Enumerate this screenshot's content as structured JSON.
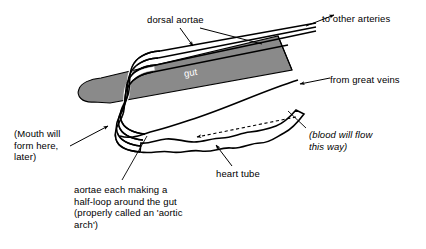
{
  "figure": {
    "kind": "embryo-circulatory-diagram",
    "background_color": "#ffffff",
    "line_color": "#000000",
    "gut_fill_color": "#8a8a8a",
    "gut_label_color": "#ffffff"
  },
  "labels": {
    "dorsal_aortae": "dorsal aortae",
    "to_other_arteries": "to other arteries",
    "from_great_veins": "from great veins",
    "gut": "gut",
    "heart_tube": "heart tube",
    "blood_flow_line1": "(blood will flow",
    "blood_flow_line2": "this way)",
    "mouth_line1": "(Mouth will",
    "mouth_line2": "form here,",
    "mouth_line3": "later)",
    "aortic_arch_line1": "aortae each making a",
    "aortic_arch_line2": "half-loop around the gut",
    "aortic_arch_line3": "(properly called an 'aortic",
    "aortic_arch_line4": "arch')"
  },
  "annotations": {
    "arrow_to_other_arteries": "solid arrowhead pointing up-right",
    "arrow_from_great_veins": "solid arrowhead pointing left",
    "arrow_blood_flow": "dashed arrow pointing left inside heart tube",
    "arrow_mouth": "solid arrowhead pointing up-right at gut tip",
    "arrow_dorsal_aortae": "solid arrowhead pointing down-left at aortae",
    "arrow_heart_tube": "solid arrowhead pointing up-left at heart tube"
  }
}
